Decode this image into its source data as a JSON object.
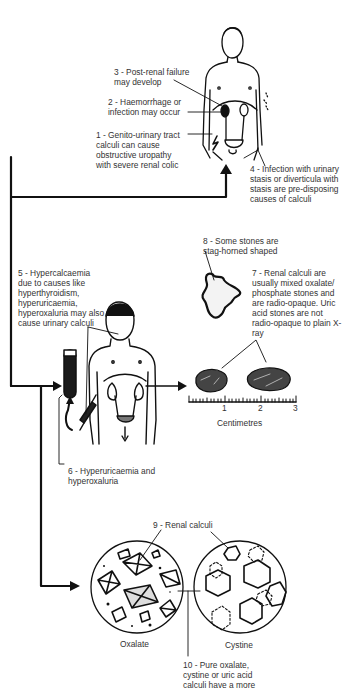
{
  "diagram": {
    "type": "medical-illustration",
    "topic": "Renal / urinary calculi",
    "labels": {
      "l1": "1 - Genito-urinary tract\ncalculi can cause\nobstructive uropathy\nwith severe renal colic",
      "l2": "2 - Haemorrhage or\ninfection may occur",
      "l3": "3 - Post-renal failure\nmay develop",
      "l4": "4 - Infection with urinary\nstasis or diverticula with\nstasis are pre-disposing\ncauses of calculi",
      "l5": "5 - Hypercalcaemia\ndue to causes like\nhyperthyroidism,\nhyperuricaemia,\nhyperoxaluria may also\ncause urinary calculi",
      "l6": "6 - Hyperuricaemia and\nhyperoxaluria",
      "l7": "7 - Renal calculi are\nusually mixed oxalate/\nphosphate stones and\nare radio-opaque. Uric\nacid stones are not\nradio-opaque to plain X-\nray",
      "l8": "8 - Some stones are\nstag-horned shaped",
      "l9": "9 - Renal calculi",
      "l10": "10 - Pure oxalate,\ncystine or uric acid\ncalculi have a more"
    },
    "scale": {
      "ticks": [
        "1",
        "2",
        "3"
      ],
      "unit_label": "Centimetres"
    },
    "microscopy": {
      "left_label": "Oxalate",
      "right_label": "Cystine"
    },
    "colors": {
      "ink": "#111111",
      "text": "#333333",
      "background": "#ffffff"
    }
  }
}
